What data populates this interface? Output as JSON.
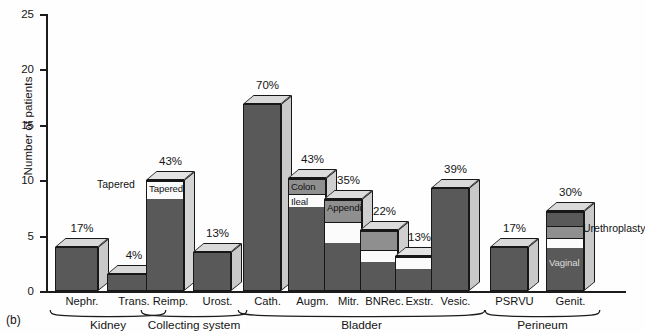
{
  "figure": {
    "panel_tag": "(b)",
    "y_axis_title": "Number of patients",
    "y_ticks": [
      "0",
      "5",
      "10",
      "15",
      "20",
      "25"
    ],
    "y_max": 25
  },
  "chart_data": {
    "type": "bar",
    "title": "",
    "xlabel": "",
    "ylabel": "Number of patients",
    "ylim": [
      0,
      25
    ],
    "grid": false,
    "legend": "none",
    "stacked": true,
    "categories": [
      "Nephr.",
      "Trans.",
      "Reimp.",
      "Urost.",
      "Cath.",
      "Augm.",
      "Mitr.",
      "BNRec.",
      "Exstr.",
      "Vesic.",
      "PSRVU",
      "Genit."
    ],
    "values": [
      4,
      1.5,
      10,
      3.5,
      16.9,
      10.2,
      8.3,
      5.5,
      3.2,
      9.3,
      4,
      7.2
    ],
    "data_labels": [
      "17%",
      "4%",
      "43%",
      "13%",
      "70%",
      "43%",
      "35%",
      "22%",
      "13%",
      "39%",
      "17%",
      "30%"
    ],
    "groups": [
      {
        "name": "Kidney",
        "categories": [
          "Nephr.",
          "Trans."
        ]
      },
      {
        "name": "Collecting system",
        "categories": [
          "Reimp.",
          "Urost."
        ]
      },
      {
        "name": "Bladder",
        "categories": [
          "Cath.",
          "Augm.",
          "Mitr.",
          "BNRec.",
          "Exstr.",
          "Vesic."
        ]
      },
      {
        "name": "Perineum",
        "categories": [
          "PSRVU",
          "Genit."
        ]
      }
    ],
    "bars": [
      {
        "category": "Nephr.",
        "pct": "17%",
        "total": 4,
        "segments": [
          {
            "value": 4,
            "shade": "dark",
            "label": ""
          }
        ]
      },
      {
        "category": "Trans.",
        "pct": "4%",
        "total": 1.5,
        "segments": [
          {
            "value": 1.5,
            "shade": "dark",
            "label": ""
          }
        ]
      },
      {
        "category": "Reimp.",
        "pct": "43%",
        "total": 10,
        "segments": [
          {
            "value": 8.4,
            "shade": "dark",
            "label": ""
          },
          {
            "value": 1.6,
            "shade": "white",
            "label": "Tapered"
          }
        ]
      },
      {
        "category": "Urost.",
        "pct": "13%",
        "total": 3.5,
        "segments": [
          {
            "value": 3.5,
            "shade": "dark",
            "label": ""
          }
        ]
      },
      {
        "category": "Cath.",
        "pct": "70%",
        "total": 16.9,
        "segments": [
          {
            "value": 16.9,
            "shade": "dark",
            "label": ""
          }
        ]
      },
      {
        "category": "Augm.",
        "pct": "43%",
        "total": 10.2,
        "segments": [
          {
            "value": 7.6,
            "shade": "dark",
            "label": ""
          },
          {
            "value": 1.2,
            "shade": "white",
            "label": "Ileal"
          },
          {
            "value": 1.4,
            "shade": "mid",
            "label": "Colon"
          }
        ]
      },
      {
        "category": "Mitr.",
        "pct": "35%",
        "total": 8.3,
        "segments": [
          {
            "value": 4.3,
            "shade": "dark",
            "label": ""
          },
          {
            "value": 2.0,
            "shade": "white",
            "label": ""
          },
          {
            "value": 2.0,
            "shade": "mid",
            "label": "Appendix"
          }
        ]
      },
      {
        "category": "BNRec.",
        "pct": "22%",
        "total": 5.5,
        "segments": [
          {
            "value": 2.6,
            "shade": "dark",
            "label": ""
          },
          {
            "value": 1.1,
            "shade": "white",
            "label": ""
          },
          {
            "value": 1.8,
            "shade": "mid",
            "label": ""
          }
        ]
      },
      {
        "category": "Exstr.",
        "pct": "13%",
        "total": 3.2,
        "segments": [
          {
            "value": 2.0,
            "shade": "dark",
            "label": ""
          },
          {
            "value": 1.2,
            "shade": "white",
            "label": ""
          }
        ]
      },
      {
        "category": "Vesic.",
        "pct": "39%",
        "total": 9.3,
        "segments": [
          {
            "value": 9.3,
            "shade": "dark",
            "label": ""
          }
        ]
      },
      {
        "category": "PSRVU",
        "pct": "17%",
        "total": 4,
        "segments": [
          {
            "value": 4,
            "shade": "dark",
            "label": ""
          }
        ]
      },
      {
        "category": "Genit.",
        "pct": "30%",
        "total": 7.2,
        "segments": [
          {
            "value": 3.9,
            "shade": "dark",
            "label": "Vaginal"
          },
          {
            "value": 0.9,
            "shade": "white",
            "label": ""
          },
          {
            "value": 1.1,
            "shade": "mid",
            "label": ""
          },
          {
            "value": 1.3,
            "shade": "dark",
            "label": ""
          }
        ]
      }
    ],
    "annotations": [
      {
        "text": "Tapered",
        "target": "Reimp."
      },
      {
        "text": "Colon",
        "target": "Augm."
      },
      {
        "text": "Ileal",
        "target": "Augm."
      },
      {
        "text": "Appendix",
        "target": "Mitr."
      },
      {
        "text": "Vaginal",
        "target": "Genit."
      },
      {
        "text": "Urethroplasty",
        "target": "Genit."
      }
    ],
    "colors": {
      "dark_face": "#595959",
      "mid_face": "#8f8f8f",
      "light_face": "#d8d8d8",
      "white_face": "#fbfbfb",
      "outline": "#171717",
      "background": "#fefefe"
    }
  }
}
